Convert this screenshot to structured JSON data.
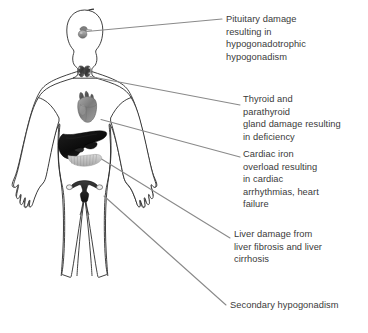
{
  "figure": {
    "type": "anatomical-diagram",
    "body_outline": {
      "stroke_color": "#2b2b2b",
      "fill_color": "#ffffff"
    },
    "leader_line_color": "#8a8a8a",
    "text_color": "#3a3a3a",
    "background_color": "#ffffff"
  },
  "organs": [
    {
      "name": "pituitary-gland",
      "label": "pituitary gland",
      "region": "head"
    },
    {
      "name": "thyroid-gland",
      "label": "thyroid and parathyroid gland",
      "region": "neck"
    },
    {
      "name": "heart",
      "label": "heart",
      "region": "chest"
    },
    {
      "name": "liver",
      "label": "liver",
      "region": "abdomen"
    },
    {
      "name": "pancreas",
      "label": "pancreas",
      "region": "abdomen"
    },
    {
      "name": "uterus",
      "label": "uterus and ovaries",
      "region": "pelvis"
    }
  ],
  "callouts": [
    {
      "id": "pituitary",
      "lines": [
        "Pituitary damage",
        "resulting in",
        "hypogonadotrophic",
        "hypogonadism"
      ],
      "text": "Pituitary damage\nresulting in\nhypogonadotrophic\nhypogonadism",
      "points_to": "pituitary-gland"
    },
    {
      "id": "thyroid",
      "lines": [
        "Thyroid and",
        "parathyroid",
        "gland damage resulting",
        "in deficiency"
      ],
      "text": "Thyroid and\nparathyroid\ngland damage resulting\nin deficiency",
      "points_to": "thyroid-gland"
    },
    {
      "id": "cardiac",
      "lines": [
        "Cardiac iron",
        "overload resulting",
        "in cardiac",
        "arrhythmias, heart",
        "failure"
      ],
      "text": "Cardiac iron\noverload resulting\nin cardiac\narrhythmias, heart\nfailure",
      "points_to": "heart"
    },
    {
      "id": "liver",
      "lines": [
        "Liver damage from",
        "liver fibrosis and liver",
        "cirrhosis"
      ],
      "text": "Liver damage from\nliver fibrosis and liver\ncirrhosis",
      "points_to": "liver"
    },
    {
      "id": "secondary",
      "lines": [
        "Secondary hypogonadism"
      ],
      "text": "Secondary hypogonadism",
      "points_to": "uterus"
    }
  ]
}
